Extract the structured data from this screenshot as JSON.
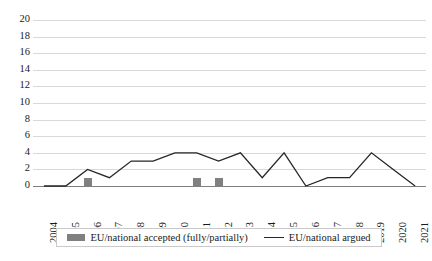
{
  "chart_data": {
    "type": "bar",
    "title": "",
    "subtitle": "",
    "xlabel": "",
    "ylabel": "",
    "categories": [
      "2004",
      "2005",
      "2006",
      "2007",
      "2008",
      "2009",
      "2010",
      "2011",
      "2012",
      "2013",
      "2014",
      "2015",
      "2016",
      "2017",
      "2018",
      "2019",
      "2020",
      "2021"
    ],
    "series": [
      {
        "name": "EU/national accepted (fully/partially)",
        "type": "bar",
        "color": "#808080",
        "values": [
          0,
          0,
          1,
          0,
          0,
          0,
          0,
          1,
          1,
          0,
          0,
          0,
          0,
          0,
          0,
          0,
          0,
          0
        ]
      },
      {
        "name": "EU/national argued",
        "type": "line",
        "color": "#262626",
        "values": [
          0,
          0,
          2,
          1,
          3,
          3,
          4,
          4,
          3,
          4,
          1,
          4,
          0,
          1,
          1,
          4,
          2,
          0
        ]
      }
    ],
    "ylim": [
      0,
      20
    ],
    "ytick_step": 2,
    "yticks": [
      0,
      2,
      4,
      6,
      8,
      10,
      12,
      14,
      16,
      18,
      20
    ],
    "ytick_labels": [
      "0",
      "2",
      "4",
      "6",
      "8",
      "10",
      "12",
      "14",
      "16",
      "18",
      "20"
    ],
    "grid": true,
    "grid_axis": "y",
    "legend_position": "bottom",
    "xtick_rotation": 90
  },
  "legend": {
    "entries": [
      {
        "label": "EU/national accepted (fully/partially)",
        "marker": "bar-swatch",
        "color": "#808080"
      },
      {
        "label": "EU/national argued",
        "marker": "line-swatch",
        "color": "#262626"
      }
    ]
  },
  "colors": {
    "bar": "#808080",
    "line": "#262626",
    "gridline": "#d9d9d9",
    "axis": "#7f7f7f",
    "background": "#ffffff",
    "text": "#1a1a1a"
  }
}
